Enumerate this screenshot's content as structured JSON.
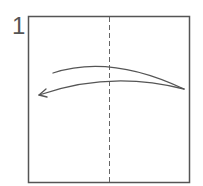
{
  "diagram": {
    "step_number": "1",
    "paper": {
      "x": 28,
      "y": 16,
      "width": 161,
      "height": 166,
      "stroke": "#555555"
    },
    "fold_line": {
      "type": "valley",
      "style": "dashed",
      "x": 109
    },
    "arrow": {
      "direction": "right-to-left",
      "description": "fold right edge over to left"
    }
  }
}
